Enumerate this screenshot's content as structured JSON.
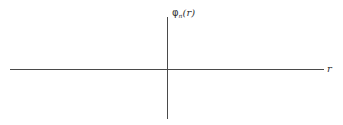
{
  "diagram": {
    "type": "coordinate-axes",
    "y_axis": {
      "symbol": "φ",
      "subscript": "n",
      "argument": "(r)"
    },
    "x_axis": {
      "label": "r"
    },
    "colors": {
      "axis": "#4a4a4a",
      "text": "#333333",
      "background": "#ffffff"
    }
  }
}
